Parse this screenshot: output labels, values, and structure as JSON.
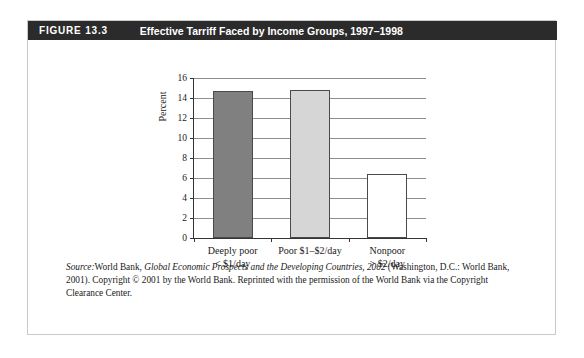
{
  "figure": {
    "number_label": "FIGURE 13.3",
    "title": "Effective Tarriff Faced by Income Groups, 1997–1998"
  },
  "source_note": {
    "label": "Source:",
    "publisher_lead": "World Bank, ",
    "book_title": "Global Economic Prospects and the Developing Countries, 2002",
    "rest": " (Washington, D.C.: World Bank, 2001). Copyright © 2001 by the World Bank. Reprinted with the permission of the World Bank via the Copyright Clearance Center."
  },
  "chart_data": {
    "type": "bar",
    "title": "Effective Tarriff Faced by Income Groups, 1997–1998",
    "xlabel": "",
    "ylabel": "Percent",
    "ylim": [
      0,
      16
    ],
    "ytick_step": 2,
    "yticks": [
      0,
      2,
      4,
      6,
      8,
      10,
      12,
      14,
      16
    ],
    "ytick_labels": [
      "0",
      "2",
      "4",
      "6",
      "8",
      "10",
      "12",
      "14",
      "16"
    ],
    "grid": true,
    "legend": false,
    "categories": [
      "Deeply poor\n< $1/day",
      "Poor $1–$2/day",
      "Nonpoor\n> $2/day"
    ],
    "category_lines": [
      [
        "Deeply poor",
        "< $1/day"
      ],
      [
        "Poor $1–$2/day",
        ""
      ],
      [
        "Nonpoor",
        "> $2/day"
      ]
    ],
    "values": [
      14.7,
      14.8,
      6.4
    ],
    "bar_colors": [
      "#808080",
      "#d6d6d6",
      "#ffffff"
    ],
    "bar_edge_color": "#4a4a4a"
  },
  "colors": {
    "header_bar": "#2b2b2b",
    "header_text": "#ffffff",
    "frame_border": "#c9c9c9",
    "axis": "#343434",
    "gridline": "#8e8e8e",
    "text": "#1a1a1a"
  }
}
